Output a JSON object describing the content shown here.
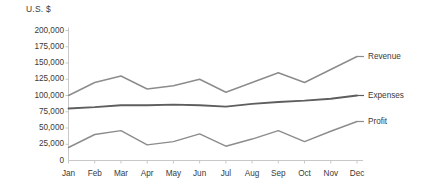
{
  "chart_data": {
    "type": "line",
    "title": "",
    "subtitle": "",
    "xlabel": "",
    "ylabel": "U.S. $",
    "axis_title": "U.S. $",
    "categories": [
      "Jan",
      "Feb",
      "Mar",
      "Apr",
      "May",
      "Jun",
      "Jul",
      "Aug",
      "Sep",
      "Oct",
      "Nov",
      "Dec"
    ],
    "ylim": [
      0,
      200000
    ],
    "ytick_values": [
      0,
      25000,
      50000,
      75000,
      100000,
      125000,
      150000,
      175000,
      200000
    ],
    "ytick_labels": [
      "0",
      "25,000",
      "50,000",
      "75,000",
      "100,000",
      "125,000",
      "150,000",
      "175,000",
      "200,000"
    ],
    "grid": false,
    "legend_position": "right-inline-labels",
    "series": [
      {
        "name": "Revenue",
        "color": "#8c8c8c",
        "values": [
          100000,
          120000,
          130000,
          110000,
          115000,
          125000,
          105000,
          120000,
          135000,
          120000,
          140000,
          160000
        ]
      },
      {
        "name": "Expenses",
        "color": "#5e5e5e",
        "values": [
          80000,
          82000,
          85000,
          85000,
          86000,
          85000,
          83000,
          87000,
          90000,
          92000,
          95000,
          100000
        ]
      },
      {
        "name": "Profit",
        "color": "#8c8c8c",
        "values": [
          20000,
          40000,
          46000,
          24000,
          29000,
          41000,
          22000,
          33000,
          46000,
          29000,
          45000,
          60000
        ]
      }
    ]
  },
  "style": {
    "axis_color": "#c8c8c8",
    "text_color": "#3a3a3a",
    "background": "#ffffff"
  }
}
